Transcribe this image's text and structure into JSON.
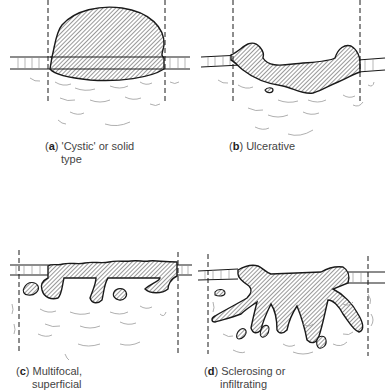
{
  "figure": {
    "panels": [
      {
        "id": "a",
        "letter": "a",
        "line1": "'Cystic' or solid",
        "line2": "type"
      },
      {
        "id": "b",
        "letter": "b",
        "line1": "Ulcerative",
        "line2": ""
      },
      {
        "id": "c",
        "letter": "c",
        "line1": "Multifocal,",
        "line2": "superficial"
      },
      {
        "id": "d",
        "letter": "d",
        "line1": "Sclerosing or",
        "line2": "infiltrating"
      }
    ],
    "colors": {
      "ink": "#1a1a1a",
      "hatch": "#333333",
      "stroma": "#9a9a9a",
      "caption": "#444444"
    }
  }
}
